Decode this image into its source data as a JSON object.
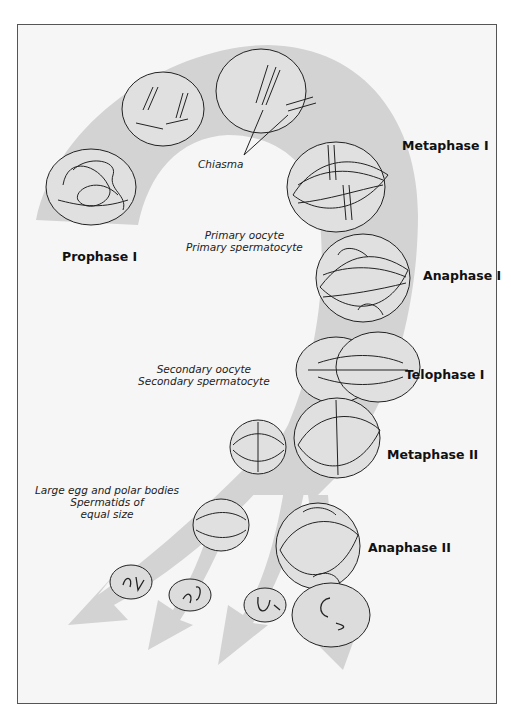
{
  "figure": {
    "colors": {
      "background": "#f6f6f6",
      "band": "#d3d3d3",
      "outline": "#222222",
      "cell_fill": "#e6e6e6"
    },
    "stages": [
      {
        "label": "Prophase I"
      },
      {
        "label": "Metaphase I"
      },
      {
        "label": "Anaphase I"
      },
      {
        "label": "Telophase I"
      },
      {
        "label": "Metaphase II"
      },
      {
        "label": "Anaphase II"
      }
    ],
    "annotations": {
      "chiasma": "Chiasma",
      "primary": {
        "line1": "Primary oocyte",
        "line2": "Primary spermatocyte"
      },
      "secondary": {
        "line1": "Secondary oocyte",
        "line2": "Secondary spermatocyte"
      },
      "products": {
        "line1": "Large egg and polar bodies",
        "line2": "Spermatids of",
        "line3": "equal size"
      }
    }
  }
}
